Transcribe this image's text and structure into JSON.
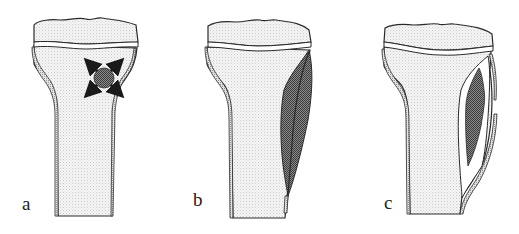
{
  "figure": {
    "panels": [
      {
        "id": "a",
        "label": "a",
        "description": "Bone with central metaphyseal lesion expanding outward (arrows)"
      },
      {
        "id": "b",
        "label": "b",
        "description": "Lesion enlarged, elongated along the cortex, thinning it"
      },
      {
        "id": "c",
        "label": "c",
        "description": "Lesion with cortical breakthrough and periosteal reaction"
      }
    ],
    "colors": {
      "outline": "#2a2a2a",
      "bone_fill": "#f2f2f2",
      "lesion_fill": "#6e6e6e",
      "background": "#ffffff"
    }
  }
}
